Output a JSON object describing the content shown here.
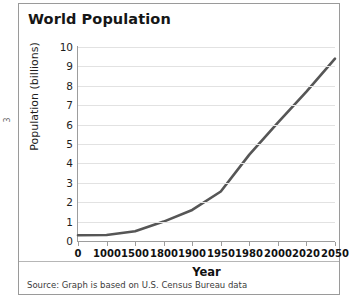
{
  "page_marker": "3",
  "chart_data": {
    "type": "line",
    "title": "World Population",
    "xlabel": "Year",
    "ylabel": "Population  (billions)",
    "source": "Source: Graph is based on U.S. Census Bureau data",
    "grid": true,
    "legend": "none",
    "categories": [
      "0",
      "1000",
      "1500",
      "1800",
      "1900",
      "1950",
      "1980",
      "2000",
      "2020",
      "2050"
    ],
    "x_tick_labels": [
      "0",
      "1000",
      "1500",
      "1800",
      "1900",
      "1950",
      "1980",
      "2000",
      "2020",
      "2050"
    ],
    "y_tick_labels": [
      "10",
      "9",
      "8",
      "7",
      "6",
      "5",
      "4",
      "3",
      "2",
      "1",
      "0"
    ],
    "values": [
      0.3,
      0.31,
      0.5,
      1.0,
      1.6,
      2.55,
      4.45,
      6.1,
      7.7,
      9.4
    ],
    "ylim": [
      0,
      10
    ],
    "y_tick_step": 1,
    "series_color": "#565656",
    "grid_color": "#e2e2e2",
    "axis_color": "#9d9d9d"
  }
}
